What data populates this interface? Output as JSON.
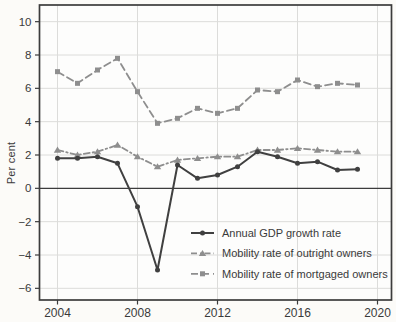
{
  "figure": {
    "ylabel": "Per cent",
    "background": "#fcfbf8"
  },
  "chart_data": {
    "type": "line",
    "title": "",
    "xlabel": "",
    "ylabel": "Per cent",
    "x": [
      2004,
      2005,
      2006,
      2007,
      2008,
      2009,
      2010,
      2011,
      2012,
      2013,
      2014,
      2015,
      2016,
      2017,
      2018,
      2019
    ],
    "series": [
      {
        "name": "Annual GDP growth rate",
        "marker": "circle",
        "line": "solid",
        "color": "#404040",
        "values": [
          1.8,
          1.8,
          1.9,
          1.5,
          -1.1,
          -4.9,
          1.4,
          0.6,
          0.8,
          1.3,
          2.2,
          1.9,
          1.5,
          1.6,
          1.1,
          1.15
        ]
      },
      {
        "name": "Mobility rate of outright owners",
        "marker": "triangle",
        "line": "dashdot",
        "color": "#8e8e8e",
        "values": [
          2.3,
          2.0,
          2.2,
          2.6,
          1.9,
          1.3,
          1.7,
          1.8,
          1.9,
          1.9,
          2.3,
          2.3,
          2.4,
          2.3,
          2.2,
          2.2
        ]
      },
      {
        "name": "Mobility rate of mortgaged owners",
        "marker": "square",
        "line": "dashed",
        "color": "#8e8e8e",
        "values": [
          7.0,
          6.3,
          7.1,
          7.8,
          5.8,
          3.9,
          4.2,
          4.8,
          4.5,
          4.8,
          5.9,
          5.8,
          6.5,
          6.1,
          6.3,
          6.2
        ]
      }
    ],
    "xticks": [
      2004,
      2008,
      2012,
      2016,
      2020
    ],
    "yticks": [
      -6,
      -4,
      -2,
      0,
      2,
      4,
      6,
      8,
      10
    ],
    "xlim": [
      2003.1,
      2020.7
    ],
    "ylim": [
      -6.7,
      11.0
    ],
    "grid": true,
    "zero_line": true,
    "legend_position": "lower right",
    "colors": {
      "grid": "#dcdcda",
      "axis_box": "#3c3c3c",
      "zero_line": "#3c3c3c",
      "tick_text": "#3a3a3a"
    }
  }
}
